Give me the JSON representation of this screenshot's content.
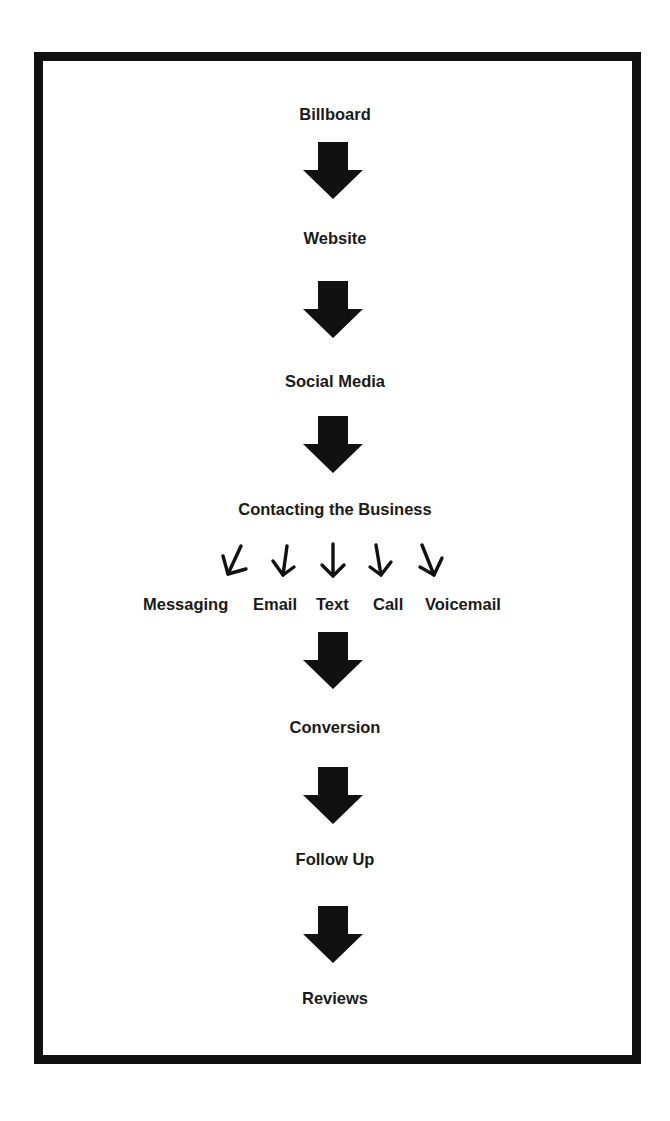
{
  "diagram": {
    "type": "vertical-flowchart",
    "colors": {
      "border": "#111111",
      "arrow": "#111111",
      "text": "#1a1a1a",
      "background": "#ffffff"
    },
    "steps": [
      {
        "label": "Billboard"
      },
      {
        "label": "Website"
      },
      {
        "label": "Social Media"
      },
      {
        "label": "Contacting the Business"
      },
      {
        "label": "Conversion"
      },
      {
        "label": "Follow Up"
      },
      {
        "label": "Reviews"
      }
    ],
    "branch": {
      "from": "Contacting the Business",
      "channels": [
        {
          "label": "Messaging"
        },
        {
          "label": "Email"
        },
        {
          "label": "Text"
        },
        {
          "label": "Call"
        },
        {
          "label": "Voicemail"
        }
      ]
    },
    "connectors": [
      {
        "from": "Billboard",
        "to": "Website",
        "icon": "block-arrow-down"
      },
      {
        "from": "Website",
        "to": "Social Media",
        "icon": "block-arrow-down"
      },
      {
        "from": "Social Media",
        "to": "Contacting the Business",
        "icon": "block-arrow-down"
      },
      {
        "from": "Contacting the Business",
        "to": "channels",
        "icon": "line-arrows-fanning-down"
      },
      {
        "from": "channels",
        "to": "Conversion",
        "icon": "block-arrow-down"
      },
      {
        "from": "Conversion",
        "to": "Follow Up",
        "icon": "block-arrow-down"
      },
      {
        "from": "Follow Up",
        "to": "Reviews",
        "icon": "block-arrow-down"
      }
    ]
  }
}
